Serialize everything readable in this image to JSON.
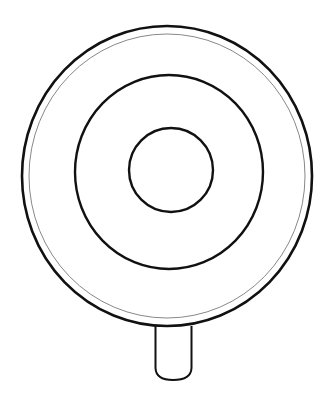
{
  "image": {
    "subject": "lollipop line drawing",
    "background": "#ffffff",
    "stroke_color": "#111111",
    "thin_stroke_color": "#888888"
  },
  "shapes": {
    "outer_circle": {
      "cx": 167,
      "cy": 176,
      "rx": 145,
      "ry": 150
    },
    "inner_rim": {
      "cx": 167,
      "cy": 176,
      "rx": 138,
      "ry": 142
    },
    "middle_ring": {
      "cx": 169,
      "cy": 172,
      "rx": 94,
      "ry": 97
    },
    "center_circle": {
      "cx": 171,
      "cy": 170,
      "rx": 42,
      "ry": 42
    },
    "stick": {
      "x": 155,
      "y": 326,
      "width": 37,
      "height": 55
    }
  }
}
